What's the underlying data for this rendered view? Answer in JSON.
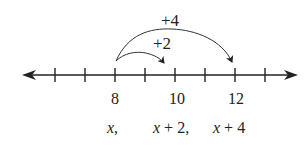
{
  "diagram": {
    "type": "number-line",
    "ticks": 8,
    "tick_labels": [
      {
        "value": "8",
        "tick_index": 2
      },
      {
        "value": "10",
        "tick_index": 4
      },
      {
        "value": "12",
        "tick_index": 6
      }
    ],
    "expressions": {
      "first": {
        "var": "x",
        "suffix": ","
      },
      "second": {
        "var": "x",
        "rest": " + 2,"
      },
      "third": {
        "var": "x",
        "rest": " + 4"
      }
    },
    "arcs": [
      {
        "label": "+2",
        "from": "8",
        "to": "10"
      },
      {
        "label": "+4",
        "from": "8",
        "to": "12"
      }
    ],
    "color": "#222222"
  }
}
